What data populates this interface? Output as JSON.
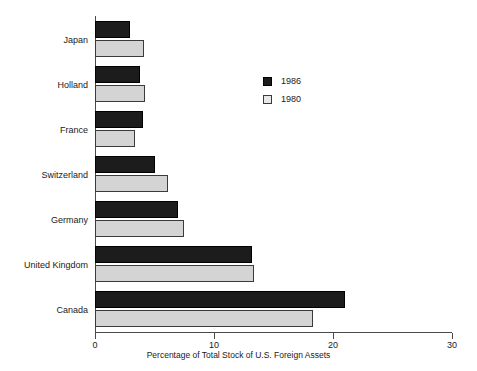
{
  "chart_data": {
    "type": "bar",
    "orientation": "horizontal",
    "title": "",
    "xlabel": "Percentage of Total Stock of U.S. Foreign Assets",
    "ylabel": "",
    "xlim": [
      0,
      30
    ],
    "xticks": [
      0,
      10,
      20,
      30
    ],
    "xtick_labels": [
      "0",
      "10",
      "20",
      "30"
    ],
    "grid": false,
    "legend_position": "upper-center-right",
    "categories": [
      "Japan",
      "Holland",
      "France",
      "Switzerland",
      "Germany",
      "United Kingdom",
      "Canada"
    ],
    "series": [
      {
        "name": "1986",
        "color": "#1c1c1c",
        "values": [
          2.9,
          3.8,
          4.0,
          5.0,
          7.0,
          13.2,
          21.0
        ]
      },
      {
        "name": "1980",
        "color": "#d4d4d4",
        "values": [
          4.1,
          4.2,
          3.4,
          6.1,
          7.5,
          13.4,
          18.3
        ]
      }
    ]
  },
  "legend": {
    "entries": [
      {
        "label": "1986",
        "swatch": "dark"
      },
      {
        "label": "1980",
        "swatch": "light"
      }
    ]
  },
  "axis": {
    "x_title": "Percentage of Total Stock of U.S. Foreign Assets"
  },
  "colors": {
    "series_1986": "#1c1c1c",
    "series_1980": "#d4d4d4",
    "axis": "#4a4a4a",
    "text": "#1a1a1a",
    "background": "#ffffff"
  }
}
